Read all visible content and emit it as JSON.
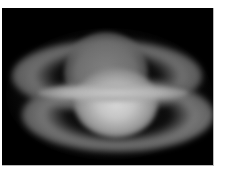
{
  "image": {
    "subject": "saturn-planet-blurred-doubled",
    "alt": "Blurred grayscale telescope image of Saturn with rings, appearing doubled",
    "background_color": "#000000",
    "frame_color": "#ffffff"
  }
}
